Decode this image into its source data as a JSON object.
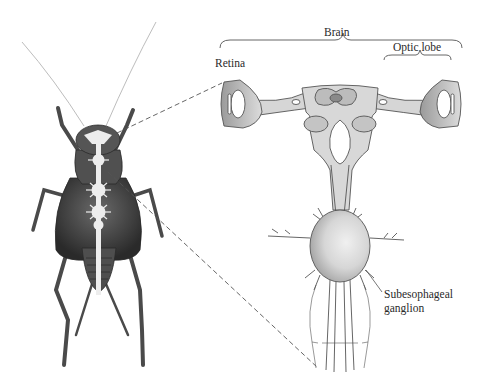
{
  "figure": {
    "type": "anatomical-diagram",
    "labels": {
      "brain": "Brain",
      "retina": "Retina",
      "optic_lobe": "Optic lobe",
      "subesophageal_line1": "Subesophageal",
      "subesophageal_line2": "ganglion"
    },
    "colors": {
      "background": "#ffffff",
      "insect_body": "#4a4a4a",
      "nerve_cord": "#e8e8e8",
      "brain_tissue": "#d4d4d4",
      "outline": "#555555",
      "text": "#2a2a2a"
    }
  }
}
